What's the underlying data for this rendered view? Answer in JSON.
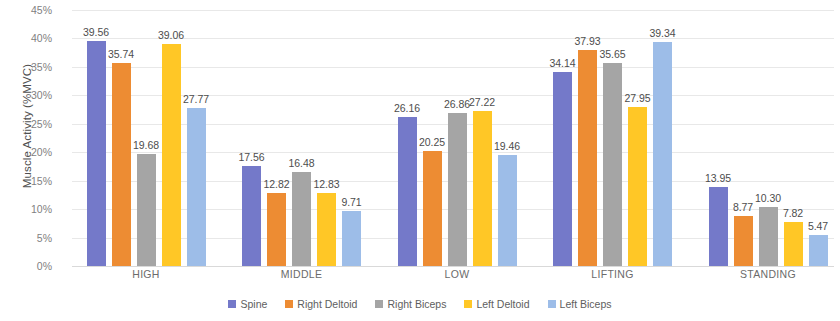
{
  "chart_data": {
    "type": "bar",
    "title": "",
    "xlabel": "",
    "ylabel": "Muscle Activity (%MVC)",
    "ylim": [
      0,
      45
    ],
    "ytick_labels": [
      "45%",
      "40%",
      "35%",
      "30%",
      "25%",
      "20%",
      "15%",
      "10%",
      "5%",
      "0%"
    ],
    "ytick_values": [
      45,
      40,
      35,
      30,
      25,
      20,
      15,
      10,
      5,
      0
    ],
    "grid": true,
    "legend_position": "bottom",
    "categories": [
      "HIGH",
      "MIDDLE",
      "LOW",
      "LIFTING",
      "STANDING"
    ],
    "series": [
      {
        "name": "Spine",
        "color": "#7479C9",
        "values": [
          39.56,
          17.56,
          26.16,
          34.14,
          13.95
        ]
      },
      {
        "name": "Right Deltoid",
        "color": "#ED8C33",
        "values": [
          35.74,
          12.82,
          20.25,
          37.93,
          8.77
        ]
      },
      {
        "name": "Right Biceps",
        "color": "#A5A5A5",
        "values": [
          19.68,
          16.48,
          26.86,
          35.65,
          10.3
        ]
      },
      {
        "name": "Left Deltoid",
        "color": "#FFC726",
        "values": [
          39.06,
          12.83,
          27.22,
          27.95,
          7.82
        ]
      },
      {
        "name": "Left Biceps",
        "color": "#9DBDE8",
        "values": [
          27.77,
          9.71,
          19.46,
          39.34,
          5.47
        ]
      }
    ],
    "data_labels": [
      [
        "39.56",
        "35.74",
        "19.68",
        "39.06",
        "27.77"
      ],
      [
        "17.56",
        "12.82",
        "16.48",
        "12.83",
        "9.71"
      ],
      [
        "26.16",
        "20.25",
        "26.86",
        "27.22",
        "19.46"
      ],
      [
        "34.14",
        "37.93",
        "35.65",
        "27.95",
        "39.34"
      ],
      [
        "13.95",
        "8.77",
        "10.30",
        "7.82",
        "5.47"
      ]
    ]
  }
}
